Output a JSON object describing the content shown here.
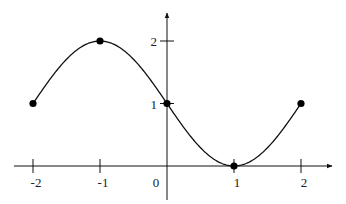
{
  "chart_data": {
    "type": "line",
    "title": "",
    "xlabel": "",
    "ylabel": "",
    "function": "y = 1 - sin(pi*x/2)",
    "xlim": [
      -2,
      2
    ],
    "ylim": [
      0,
      2
    ],
    "x_ticks": [
      "-2",
      "-1",
      "0",
      "1",
      "2"
    ],
    "y_ticks": [
      "1",
      "2"
    ],
    "grid": false,
    "legend": null,
    "series": [
      {
        "name": "curve",
        "x": [
          -2,
          -1.5,
          -1,
          -0.5,
          0,
          0.5,
          1,
          1.5,
          2
        ],
        "values": [
          1,
          1.71,
          2,
          1.71,
          1,
          0.29,
          0,
          0.29,
          1
        ]
      }
    ],
    "marked_points": [
      {
        "x": -2,
        "y": 1
      },
      {
        "x": -1,
        "y": 2
      },
      {
        "x": 0,
        "y": 1
      },
      {
        "x": 1,
        "y": 0
      },
      {
        "x": 2,
        "y": 1
      }
    ],
    "color": "#000000"
  }
}
